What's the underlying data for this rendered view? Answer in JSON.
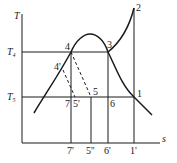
{
  "diagram": {
    "type": "T-s diagram",
    "axes": {
      "y_label": "T",
      "x_label": "s",
      "y_ticks": [
        {
          "name": "T4",
          "main": "T",
          "sub": "4"
        },
        {
          "name": "T5",
          "main": "T",
          "sub": "5"
        }
      ],
      "x_ticks": [
        "7'",
        "5''",
        "6'",
        "1'"
      ]
    },
    "points": {
      "p1": "1",
      "p2": "2",
      "p3": "3",
      "p4": "4",
      "p4prime": "4'",
      "p5": "5",
      "p5prime": "5'",
      "p6": "6",
      "p7": "7"
    },
    "line_color": "#1a1a1a"
  }
}
